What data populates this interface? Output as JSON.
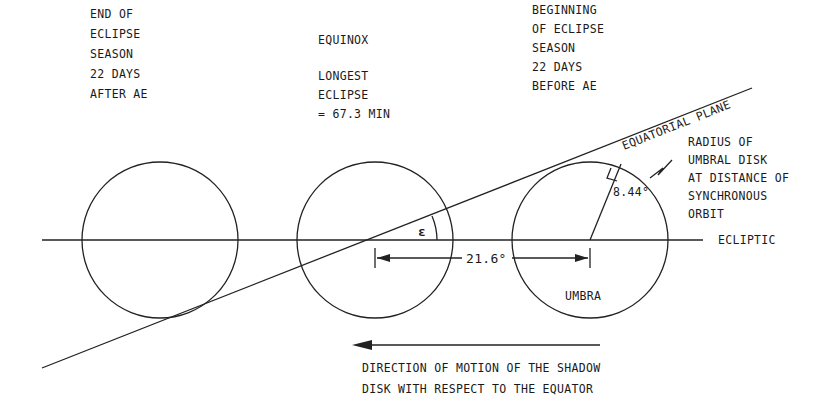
{
  "diagram": {
    "colors": {
      "ink": "#222222",
      "background": "#ffffff"
    },
    "labels": {
      "end_of_season": [
        "END OF",
        "ECLIPSE",
        "SEASON",
        "22 DAYS",
        "AFTER AE"
      ],
      "equinox": [
        "EQUINOX",
        "",
        "LONGEST",
        "ECLIPSE",
        "= 67.3 MIN"
      ],
      "beginning_of_season": [
        "BEGINNING",
        "OF ECLIPSE",
        "SEASON",
        "22 DAYS",
        "BEFORE AE"
      ],
      "equatorial_plane": "EQUATORIAL PLANE",
      "radius_note": [
        "RADIUS OF",
        "UMBRAL DISK",
        "AT DISTANCE OF",
        "SYNCHRONOUS",
        "ORBIT"
      ],
      "radius_value": "8.44°",
      "ecliptic": "ECLIPTIC",
      "epsilon": "ε",
      "separation": "21.6°",
      "umbra": "UMBRA",
      "motion_note": [
        "DIRECTION OF MOTION OF THE SHADOW",
        "DISK WITH RESPECT TO THE EQUATOR"
      ]
    },
    "disks": [
      {
        "name": "end-of-eclipse-season-disk"
      },
      {
        "name": "equinox-disk"
      },
      {
        "name": "beginning-of-eclipse-season-disk"
      }
    ]
  }
}
